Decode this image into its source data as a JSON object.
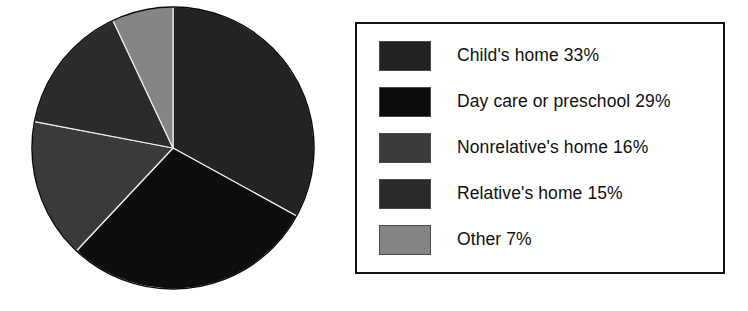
{
  "chart_data": {
    "type": "pie",
    "title": "",
    "subtitle": "",
    "xlabel": "",
    "ylabel": "",
    "grid": false,
    "legend_position": "right",
    "start_angle_deg": 0,
    "direction": "clockwise",
    "categories": [
      "Child's home",
      "Day care or preschool",
      "Nonrelative's home",
      "Relative's home",
      "Other"
    ],
    "values": [
      33,
      29,
      16,
      15,
      7
    ],
    "value_unit": "%",
    "colors": [
      "#232323",
      "#0d0d0d",
      "#3a3a3a",
      "#2b2b2b",
      "#858585"
    ],
    "slices": [
      {
        "label": "Child's home",
        "value": 33,
        "display": "Child's home 33%",
        "color": "#232323"
      },
      {
        "label": "Day care or preschool",
        "value": 29,
        "display": "Day care or preschool 29%",
        "color": "#0d0d0d"
      },
      {
        "label": "Nonrelative's home",
        "value": 16,
        "display": "Nonrelative's home 16%",
        "color": "#3a3a3a"
      },
      {
        "label": "Relative's home",
        "value": 15,
        "display": "Relative's home 15%",
        "color": "#2b2b2b"
      },
      {
        "label": "Other",
        "value": 7,
        "display": "Other 7%",
        "color": "#858585"
      }
    ]
  },
  "legend": {
    "items": [
      {
        "text": "Child's home 33%",
        "color": "#232323"
      },
      {
        "text": "Day care or preschool 29%",
        "color": "#0d0d0d"
      },
      {
        "text": "Nonrelative's home 16%",
        "color": "#3a3a3a"
      },
      {
        "text": "Relative's home 15%",
        "color": "#2b2b2b"
      },
      {
        "text": "Other 7%",
        "color": "#858585"
      }
    ],
    "border_color": "#141414"
  },
  "pie_geometry": {
    "center_x": 173,
    "center_y": 148,
    "radius": 141,
    "outline_color": "#000000"
  }
}
